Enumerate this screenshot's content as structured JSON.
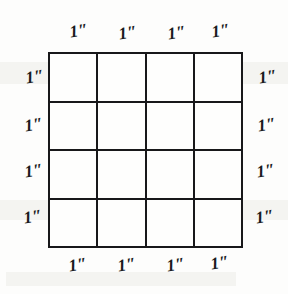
{
  "figure": {
    "type": "geometry-diagram",
    "background_color": "#fdfdfc",
    "line_color": "#18181a"
  },
  "grid": {
    "rows": 4,
    "columns": 4,
    "cell_count": 16,
    "cells": [
      {
        "id": "r1c1"
      },
      {
        "id": "r1c2"
      },
      {
        "id": "r1c3"
      },
      {
        "id": "r1c4"
      },
      {
        "id": "r2c1"
      },
      {
        "id": "r2c2"
      },
      {
        "id": "r2c3"
      },
      {
        "id": "r2c4"
      },
      {
        "id": "r3c1"
      },
      {
        "id": "r3c2"
      },
      {
        "id": "r3c3"
      },
      {
        "id": "r3c4"
      },
      {
        "id": "r4c1"
      },
      {
        "id": "r4c2"
      },
      {
        "id": "r4c3"
      },
      {
        "id": "r4c4"
      }
    ]
  },
  "labels": {
    "top": [
      "1″",
      "1″",
      "1″",
      "1″"
    ],
    "bottom": [
      "1″",
      "1″",
      "1″",
      "1″"
    ],
    "left": [
      "1″",
      "1″",
      "1″",
      "1″"
    ],
    "right": [
      "1″",
      "1″",
      "1″",
      "1″"
    ]
  }
}
